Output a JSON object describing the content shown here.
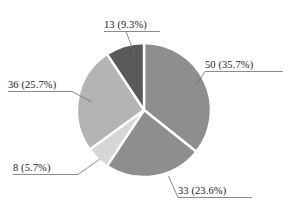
{
  "chart_data": {
    "type": "pie",
    "title": "",
    "subtitle": "",
    "xlabel": "",
    "ylabel": "",
    "total": 140,
    "legend": "none",
    "grid": false,
    "start_angle_deg": 0,
    "direction": "clockwise",
    "categories": [
      "50",
      "33",
      "8",
      "36",
      "13"
    ],
    "values": [
      50,
      33,
      8,
      36,
      13
    ],
    "percents": [
      35.7,
      23.6,
      5.7,
      25.7,
      9.3
    ],
    "slices": [
      {
        "value": 50,
        "percent": "35.7%",
        "label": "50 (35.7%)",
        "color": "#8e8e8e",
        "start_angle": 0,
        "end_angle": 128.57
      },
      {
        "value": 33,
        "percent": "23.6%",
        "label": "33 (23.6%)",
        "color": "#8e8e8e",
        "start_angle": 128.57,
        "end_angle": 213.43
      },
      {
        "value": 8,
        "percent": "5.7%",
        "label": "8 (5.7%)",
        "color": "#d6d6d6",
        "start_angle": 213.43,
        "end_angle": 233.99
      },
      {
        "value": 36,
        "percent": "25.7%",
        "label": "36 (25.7%)",
        "color": "#b4b4b4",
        "start_angle": 233.99,
        "end_angle": 326.57
      },
      {
        "value": 13,
        "percent": "9.3%",
        "label": "13 (9.3%)",
        "color": "#5a5a5a",
        "start_angle": 326.57,
        "end_angle": 360
      }
    ],
    "separator_color": "#ffffff",
    "leader_line_color": "#6e6e6e",
    "background": "#ffffff"
  },
  "labels": {
    "top": "13 (9.3%)",
    "right": "50 (35.7%)",
    "bottom": "33 (23.6%)",
    "lower_left": "8 (5.7%)",
    "left": "36 (25.7%)"
  }
}
